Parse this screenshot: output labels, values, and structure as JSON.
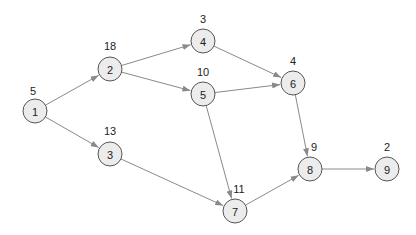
{
  "diagram": {
    "type": "directed-network",
    "node_radius": 12,
    "colors": {
      "node_fill": "#ececec",
      "node_stroke": "#555555",
      "edge": "#8a8a8a",
      "text": "#222222"
    },
    "nodes": [
      {
        "id": "1",
        "label": "1",
        "weight": "5",
        "x": 35,
        "y": 111,
        "wx": 33,
        "wy": 95
      },
      {
        "id": "2",
        "label": "2",
        "weight": "18",
        "x": 110,
        "y": 69,
        "wx": 110,
        "wy": 50
      },
      {
        "id": "3",
        "label": "3",
        "weight": "13",
        "x": 110,
        "y": 154,
        "wx": 110,
        "wy": 135
      },
      {
        "id": "4",
        "label": "4",
        "weight": "3",
        "x": 203,
        "y": 41,
        "wx": 203,
        "wy": 23
      },
      {
        "id": "5",
        "label": "5",
        "weight": "10",
        "x": 203,
        "y": 94,
        "wx": 203,
        "wy": 76
      },
      {
        "id": "6",
        "label": "6",
        "weight": "4",
        "x": 293,
        "y": 83,
        "wx": 293,
        "wy": 65
      },
      {
        "id": "7",
        "label": "7",
        "weight": "11",
        "x": 235,
        "y": 211,
        "wx": 239,
        "wy": 193
      },
      {
        "id": "8",
        "label": "8",
        "weight": "9",
        "x": 310,
        "y": 169,
        "wx": 314,
        "wy": 151
      },
      {
        "id": "9",
        "label": "9",
        "weight": "2",
        "x": 387,
        "y": 169,
        "wx": 387,
        "wy": 151
      }
    ],
    "edges": [
      {
        "from": "1",
        "to": "2"
      },
      {
        "from": "1",
        "to": "3"
      },
      {
        "from": "2",
        "to": "4"
      },
      {
        "from": "2",
        "to": "5"
      },
      {
        "from": "4",
        "to": "6"
      },
      {
        "from": "5",
        "to": "6"
      },
      {
        "from": "5",
        "to": "7"
      },
      {
        "from": "3",
        "to": "7"
      },
      {
        "from": "6",
        "to": "8"
      },
      {
        "from": "7",
        "to": "8"
      },
      {
        "from": "8",
        "to": "9"
      }
    ]
  }
}
